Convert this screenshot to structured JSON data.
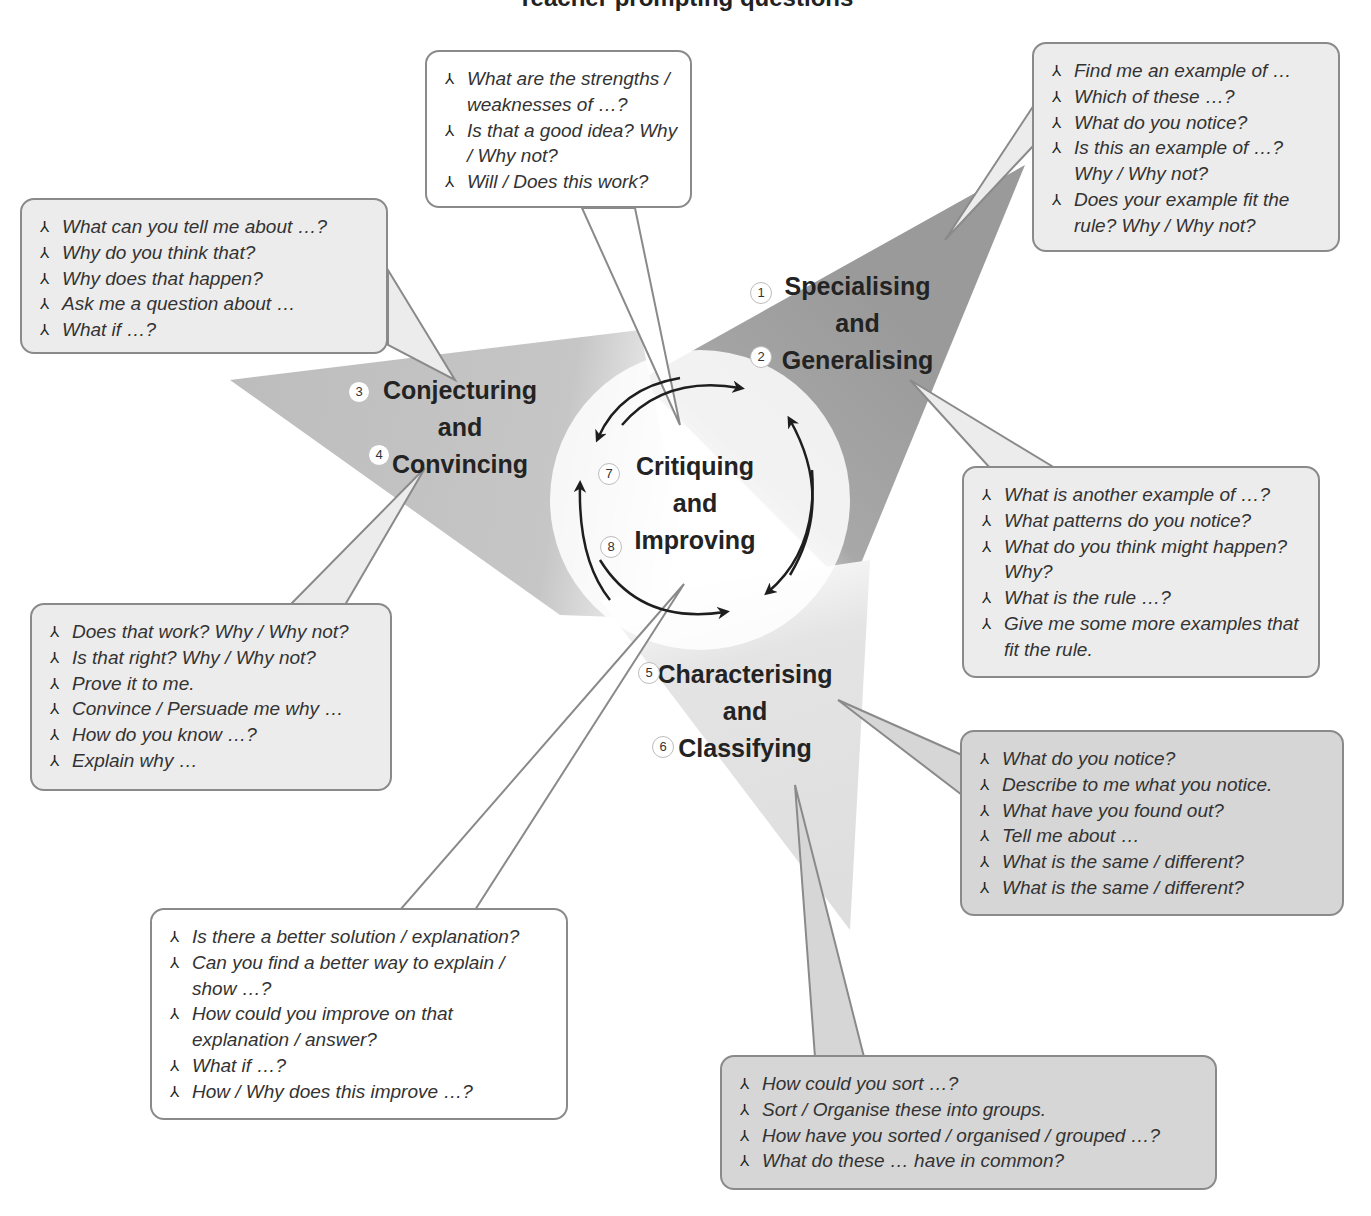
{
  "title": "Teacher prompting questions",
  "bullet_glyph": "⅄",
  "center": {
    "label_lines": [
      "Critiquing",
      "and",
      "Improving"
    ],
    "badges": [
      "7",
      "8"
    ]
  },
  "categories": [
    {
      "id": "specialising",
      "label_lines": [
        "Specialising",
        "and",
        "Generalising"
      ],
      "badges": [
        "1",
        "2"
      ]
    },
    {
      "id": "conjecturing",
      "label_lines": [
        "Conjecturing",
        "and",
        "Convincing"
      ],
      "badges": [
        "3",
        "4"
      ]
    },
    {
      "id": "characterising",
      "label_lines": [
        "Characterising",
        "and",
        "Classifying"
      ],
      "badges": [
        "5",
        "6"
      ]
    }
  ],
  "callouts": {
    "critiquing_top": [
      "What are the strengths / weaknesses of …?",
      "Is that a good idea? Why / Why not?",
      "Will / Does this work?"
    ],
    "specialising_top": [
      "Find me an example of …",
      "Which of these …?",
      "What do you notice?",
      "Is this an example of …? Why / Why not?",
      "Does your example fit the rule? Why / Why not?"
    ],
    "conjecturing_top": [
      "What can you tell me about …?",
      "Why do you think that?",
      "Why does that happen?",
      "Ask me a question about …",
      "What if …?"
    ],
    "generalising_right": [
      "What is another example of …?",
      "What patterns do you notice?",
      "What do you think might happen? Why?",
      "What is the rule …?",
      "Give me some more examples that fit the rule."
    ],
    "convincing_bottom": [
      "Does that work? Why / Why not?",
      "Is that right? Why / Why not?",
      "Prove it to me.",
      "Convince / Persuade me why …",
      "How do you know …?",
      "Explain why …"
    ],
    "characterising_right": [
      "What do you notice?",
      "Describe to me what you notice.",
      "What have you found out?",
      "Tell me about …",
      "What is the same / different?",
      "What is the same / different?"
    ],
    "improving_bottom": [
      "Is there a better solution / explanation?",
      "Can you find a better way to explain / show …?",
      "How could you improve on that explanation / answer?",
      "What if …?",
      "How / Why does this improve …?"
    ],
    "classifying_bottom": [
      "How could you sort …?",
      "Sort / Organise these into groups.",
      "How have you sorted / organised / grouped …?",
      "What do these … have in common?"
    ]
  }
}
